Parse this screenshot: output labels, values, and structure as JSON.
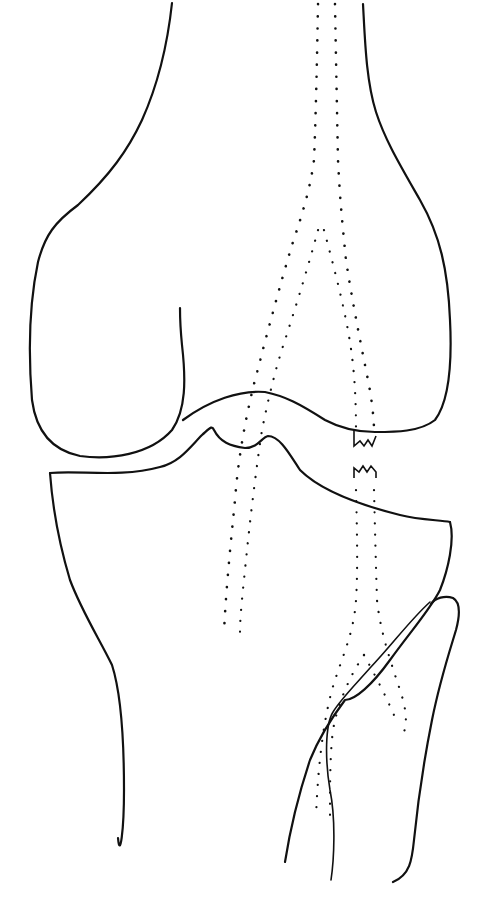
{
  "diagram": {
    "background": "#ffffff",
    "stroke_color": "#111111",
    "structures": [
      {
        "id": "femur",
        "label": "femur"
      },
      {
        "id": "tibia",
        "label": "tibia"
      },
      {
        "id": "fibula",
        "label": "fibula"
      },
      {
        "id": "ligament-bands",
        "label": "dotted ligament outlines"
      },
      {
        "id": "ligament-tear",
        "label": "torn ligament ends"
      }
    ]
  }
}
